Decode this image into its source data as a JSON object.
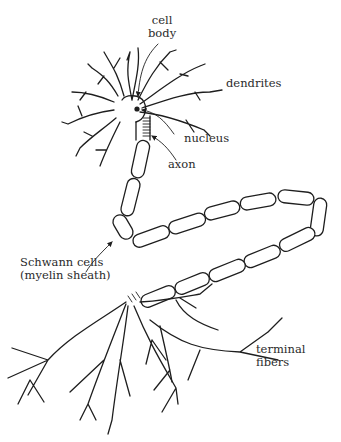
{
  "diagram": {
    "labels": {
      "cell_body_line1": "cell",
      "cell_body_line2": "body",
      "dendrites": "dendrites",
      "nucleus": "nucleus",
      "axon": "axon",
      "schwann_line1": "Schwann cells",
      "schwann_line2": "(myelin sheath)",
      "terminal_line1": "terminal",
      "terminal_line2": "fibers"
    },
    "colors": {
      "ink": "#1e1e1e",
      "text": "#2a2a2a",
      "background": "#ffffff"
    }
  }
}
